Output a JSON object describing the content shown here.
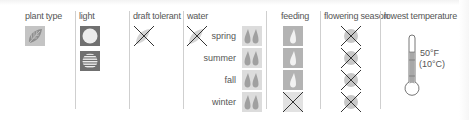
{
  "headers": {
    "plant_type": "plant type",
    "light": "light",
    "draft_tolerant": "draft tolerant",
    "water": "water",
    "feeding": "feeding",
    "flowering_season": "flowering season",
    "lowest_temperature": "lowest temperature"
  },
  "plant_type": {
    "icon": "leaf-icon",
    "value": "foliage"
  },
  "light": {
    "icons": [
      "full-sun-icon",
      "filtered-light-icon"
    ]
  },
  "draft_tolerant": {
    "value": "no",
    "icon": "x-mark-icon"
  },
  "water": {
    "general": "no",
    "seasons": [
      {
        "label": "spring",
        "amount": "two-drops"
      },
      {
        "label": "summer",
        "amount": "two-drops"
      },
      {
        "label": "fall",
        "amount": "two-drops"
      },
      {
        "label": "winter",
        "amount": "two-drops"
      }
    ]
  },
  "feeding": {
    "seasons": [
      {
        "season": "spring",
        "value": "one-drop"
      },
      {
        "season": "summer",
        "value": "one-drop"
      },
      {
        "season": "fall",
        "value": "one-drop"
      },
      {
        "season": "winter",
        "value": "none"
      }
    ]
  },
  "flowering_season": {
    "seasons": [
      {
        "season": "spring",
        "value": "no"
      },
      {
        "season": "summer",
        "value": "no"
      },
      {
        "season": "fall",
        "value": "no"
      },
      {
        "season": "winter",
        "value": "no"
      }
    ]
  },
  "lowest_temperature": {
    "fahrenheit": "50°F",
    "celsius": "(10°C)"
  },
  "colors": {
    "tile": "#b3b3b3",
    "tile_light": "#dcdcdc",
    "text": "#555555",
    "divider": "#cfcfcf"
  }
}
